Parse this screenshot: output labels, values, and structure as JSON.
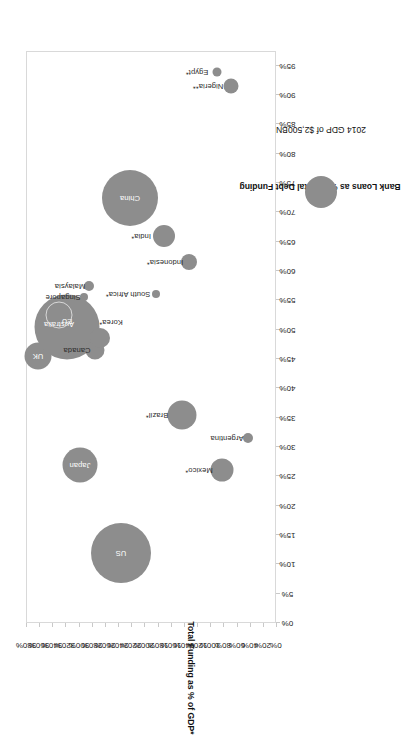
{
  "chart_data": {
    "type": "scatter",
    "title": "",
    "xlabel": "Bank Loans as % of Total Debt Funding",
    "ylabel": "Total Funding as % of GDP*",
    "xlim": [
      0,
      97.5
    ],
    "ylim": [
      0,
      380
    ],
    "grid": false,
    "xticks": [
      "0%",
      "5%",
      "10%",
      "15%",
      "20%",
      "25%",
      "30%",
      "35%",
      "40%",
      "45%",
      "50%",
      "55%",
      "60%",
      "65%",
      "70%",
      "75%",
      "80%",
      "85%",
      "90%",
      "95%"
    ],
    "xtick_values": [
      0,
      5,
      10,
      15,
      20,
      25,
      30,
      35,
      40,
      45,
      50,
      55,
      60,
      65,
      70,
      75,
      80,
      85,
      90,
      95
    ],
    "yticks": [
      "0%",
      "20%",
      "40%",
      "60%",
      "80%",
      "100%",
      "120%",
      "140%",
      "160%",
      "180%",
      "200%",
      "220%",
      "240%",
      "260%",
      "280%",
      "300%",
      "320%",
      "340%",
      "360%",
      "380%"
    ],
    "ytick_values": [
      0,
      20,
      40,
      60,
      80,
      100,
      120,
      140,
      160,
      180,
      200,
      220,
      240,
      260,
      280,
      300,
      320,
      340,
      360,
      380
    ],
    "size_legend": {
      "label": "2014 GDP of $2,500BN",
      "value_bn": 2500,
      "radius_px": 16
    },
    "bubble_color": "#8d8d8d",
    "points": [
      {
        "name": "US",
        "x": 12.0,
        "y": 235,
        "r": 30.0,
        "label_inside": true,
        "label_dx": 0,
        "label_dy": 0
      },
      {
        "name": "Japan",
        "x": 27.0,
        "y": 298,
        "r": 17.5,
        "label_inside": true,
        "label_dx": 0,
        "label_dy": 0
      },
      {
        "name": "UK",
        "x": 45.5,
        "y": 362,
        "r": 13.5,
        "label_inside": true,
        "label_dx": 0,
        "label_dy": 0
      },
      {
        "name": "EU",
        "x": 50.5,
        "y": 318,
        "r": 32.5,
        "label_inside": true,
        "label_dx": 6,
        "label_dy": 0
      },
      {
        "name": "Australia",
        "x": 52.5,
        "y": 330,
        "r": 12.5,
        "hollow": true,
        "label_inside": true,
        "label_dx": -9,
        "label_dy": 0
      },
      {
        "name": "Canada",
        "x": 46.5,
        "y": 275,
        "r": 9.5,
        "label_inside": false,
        "label_dx": 0,
        "label_dy": -18
      },
      {
        "name": "Korea*",
        "x": 48.5,
        "y": 268,
        "r": 10.0,
        "label_inside": false,
        "label_dx": 16,
        "label_dy": 11
      },
      {
        "name": "Singapore",
        "x": 55.5,
        "y": 292,
        "r": 4.0,
        "label_inside": false,
        "label_dx": 0,
        "label_dy": -21
      },
      {
        "name": "Malaysia",
        "x": 57.5,
        "y": 284,
        "r": 5.0,
        "label_inside": false,
        "label_dx": 0,
        "label_dy": -19
      },
      {
        "name": "South Africa*",
        "x": 56.0,
        "y": 182,
        "r": 4.0,
        "label_inside": false,
        "label_dx": 0,
        "label_dy": -28
      },
      {
        "name": "China",
        "x": 72.5,
        "y": 222,
        "r": 28.0,
        "label_inside": true,
        "label_dx": 0,
        "label_dy": 0
      },
      {
        "name": "India*",
        "x": 66.0,
        "y": 170,
        "r": 11.0,
        "label_inside": false,
        "label_dx": 0,
        "label_dy": -23
      },
      {
        "name": "Indonesia*",
        "x": 61.5,
        "y": 133,
        "r": 8.0,
        "label_inside": false,
        "label_dx": 0,
        "label_dy": -24
      },
      {
        "name": "Brazil*",
        "x": 35.5,
        "y": 143,
        "r": 14.5,
        "label_inside": false,
        "label_dx": 0,
        "label_dy": -25
      },
      {
        "name": "Mexico*",
        "x": 26.0,
        "y": 82,
        "r": 11.5,
        "label_inside": false,
        "label_dx": 0,
        "label_dy": -23
      },
      {
        "name": "Argentina",
        "x": 31.5,
        "y": 43,
        "r": 5.0,
        "label_inside": false,
        "label_dx": 0,
        "label_dy": -21
      },
      {
        "name": "Egypt*",
        "x": 94.0,
        "y": 90,
        "r": 4.5,
        "label_inside": false,
        "label_dx": 0,
        "label_dy": -20
      },
      {
        "name": "Nigeria**",
        "x": 91.5,
        "y": 68,
        "r": 7.5,
        "label_inside": false,
        "label_dx": 0,
        "label_dy": -23
      }
    ]
  }
}
